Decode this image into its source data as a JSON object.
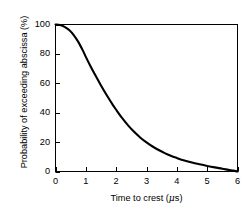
{
  "chart_data": {
    "type": "line",
    "title": "",
    "subtitle": "",
    "xlabel_text": "Time to crest (",
    "xlabel_unit": "μ",
    "xlabel_tail": "s)",
    "xlabel": "Time to crest (μs)",
    "ylabel": "Probability of exceeding abscissa (%)",
    "xlim": [
      0,
      6
    ],
    "ylim": [
      0,
      100
    ],
    "xticks": [
      "0",
      "1",
      "2",
      "3",
      "4",
      "5",
      "6"
    ],
    "xtick_values": [
      0,
      1,
      2,
      3,
      4,
      5,
      6
    ],
    "yticks": [
      "0",
      "20",
      "40",
      "60",
      "80",
      "100"
    ],
    "ytick_values": [
      0,
      20,
      40,
      60,
      80,
      100
    ],
    "grid": false,
    "legend": false,
    "legend_position": "none",
    "line_color": "#000000",
    "background_color": "#ffffff",
    "axis_color": "#000000",
    "tick_direction": "in",
    "frame": "full-box",
    "series": [
      {
        "name": "Probability of exceeding abscissa",
        "x": [
          0.0,
          0.15,
          0.3,
          0.45,
          0.6,
          0.75,
          0.9,
          1.0,
          1.15,
          1.3,
          1.5,
          1.7,
          1.9,
          2.0,
          2.2,
          2.4,
          2.6,
          2.8,
          3.0,
          3.2,
          3.4,
          3.6,
          3.8,
          4.0,
          4.25,
          4.5,
          4.75,
          5.0,
          5.25,
          5.5,
          5.7,
          5.85,
          6.0
        ],
        "y": [
          100.0,
          99.6,
          98.4,
          96.2,
          92.8,
          88.2,
          82.4,
          78.0,
          71.8,
          66.0,
          58.5,
          51.5,
          45.0,
          42.0,
          36.3,
          31.2,
          26.8,
          23.0,
          19.8,
          17.0,
          14.6,
          12.5,
          10.7,
          9.2,
          7.5,
          6.1,
          4.9,
          3.8,
          2.8,
          1.9,
          1.1,
          0.6,
          0.0
        ]
      }
    ]
  }
}
